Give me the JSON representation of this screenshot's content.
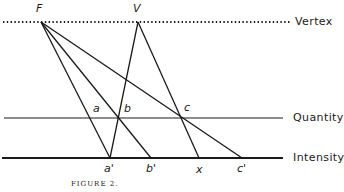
{
  "figure": {
    "caption": "FIGURE 2.",
    "lines": {
      "vertex": {
        "label": "Vertex",
        "style": "dotted"
      },
      "quantity": {
        "label": "Quantity",
        "style": "solid"
      },
      "intensity": {
        "label": "Intensity",
        "style": "solid"
      }
    },
    "points": {
      "F": "F",
      "V": "V",
      "a": "a",
      "b": "b",
      "c": "c",
      "a_prime": "a'",
      "b_prime": "b'",
      "x": "x",
      "c_prime": "c'"
    },
    "colors": {
      "ink": "#1a1a1a",
      "background": "#ffffff"
    }
  }
}
